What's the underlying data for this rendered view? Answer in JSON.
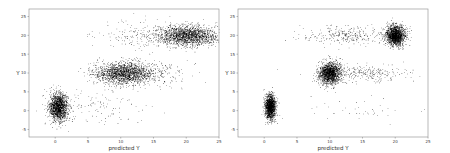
{
  "chart_data": [
    {
      "type": "scatter",
      "title": "",
      "xlabel": "predicted Y",
      "ylabel": "Y",
      "xlim": [
        -4,
        25
      ],
      "ylim": [
        -7,
        27
      ],
      "xticks": [
        0,
        5,
        10,
        15,
        20,
        25
      ],
      "yticks": [
        -5,
        0,
        5,
        10,
        15,
        20,
        25
      ],
      "grid": false,
      "legend": null,
      "point_color": "#000000",
      "clusters": [
        {
          "name": "cluster-Y0",
          "center_x": 0.5,
          "center_y": 1,
          "sd_x": 0.7,
          "sd_y": 1.8,
          "n": 1600
        },
        {
          "name": "cluster-Y10",
          "center_x": 10.5,
          "center_y": 10,
          "sd_x": 2.3,
          "sd_y": 1.4,
          "n": 1800
        },
        {
          "name": "cluster-Y20",
          "center_x": 20,
          "center_y": 20,
          "sd_x": 2.3,
          "sd_y": 1.3,
          "n": 1800
        },
        {
          "name": "scatter-Y0-tail",
          "center_x": 6,
          "center_y": 1,
          "sd_x": 4,
          "sd_y": 2,
          "n": 120
        },
        {
          "name": "scatter-Y10-tail",
          "center_x": 15,
          "center_y": 10,
          "sd_x": 3.5,
          "sd_y": 1.8,
          "n": 160
        },
        {
          "name": "scatter-Y20-tail",
          "center_x": 13,
          "center_y": 20,
          "sd_x": 3,
          "sd_y": 1.8,
          "n": 160
        }
      ]
    },
    {
      "type": "scatter",
      "title": "",
      "xlabel": "predicted Y",
      "ylabel": "Y",
      "xlim": [
        -4,
        25
      ],
      "ylim": [
        -7,
        27
      ],
      "xticks": [
        0,
        5,
        10,
        15,
        20,
        25
      ],
      "yticks": [
        -5,
        0,
        5,
        10,
        15,
        20,
        25
      ],
      "grid": false,
      "legend": null,
      "point_color": "#000000",
      "clusters": [
        {
          "name": "cluster-Y0",
          "center_x": 0.9,
          "center_y": 1,
          "sd_x": 0.4,
          "sd_y": 1.6,
          "n": 1600
        },
        {
          "name": "cluster-Y10",
          "center_x": 10,
          "center_y": 10,
          "sd_x": 0.8,
          "sd_y": 1.4,
          "n": 1700
        },
        {
          "name": "cluster-Y20",
          "center_x": 20,
          "center_y": 20,
          "sd_x": 0.7,
          "sd_y": 1.3,
          "n": 1700
        },
        {
          "name": "band-Y10",
          "center_x": 15.5,
          "center_y": 10,
          "sd_x": 3.2,
          "sd_y": 1.1,
          "n": 260
        },
        {
          "name": "band-Y20",
          "center_x": 12.5,
          "center_y": 20,
          "sd_x": 3.5,
          "sd_y": 1.2,
          "n": 300
        },
        {
          "name": "sparse-Y0",
          "center_x": 14,
          "center_y": 0.5,
          "sd_x": 4,
          "sd_y": 1.5,
          "n": 40
        }
      ]
    }
  ],
  "panels": [
    {
      "xlabel": "predicted Y",
      "ylabel": "Y"
    },
    {
      "xlabel": "predicted Y",
      "ylabel": "Y"
    }
  ]
}
